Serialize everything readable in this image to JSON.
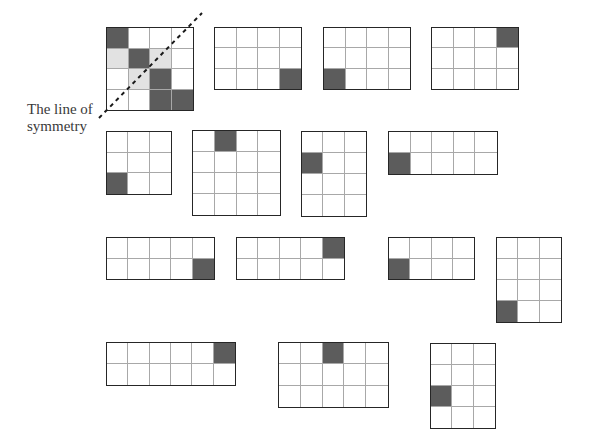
{
  "annotation": {
    "line1": "The line of",
    "line2": "symmetry"
  },
  "colors": {
    "shaded": "#5c5c5c",
    "reflected": "#e2e2e2",
    "empty": "#ffffff",
    "border": "#262626",
    "gridline": "#a8a8a8"
  },
  "grids": [
    {
      "name": "example-grid",
      "rows": 4,
      "cols": 4,
      "dark": [
        [
          0,
          0
        ],
        [
          1,
          1
        ],
        [
          2,
          2
        ],
        [
          3,
          2
        ],
        [
          3,
          3
        ]
      ],
      "light": [
        [
          1,
          0
        ],
        [
          1,
          2
        ],
        [
          2,
          1
        ]
      ]
    },
    {
      "name": "grid-2",
      "rows": 3,
      "cols": 4,
      "dark": [
        [
          2,
          3
        ]
      ],
      "light": []
    },
    {
      "name": "grid-3",
      "rows": 3,
      "cols": 4,
      "dark": [
        [
          2,
          0
        ]
      ],
      "light": []
    },
    {
      "name": "grid-4",
      "rows": 3,
      "cols": 4,
      "dark": [
        [
          0,
          3
        ]
      ],
      "light": []
    },
    {
      "name": "grid-5",
      "rows": 3,
      "cols": 3,
      "dark": [
        [
          2,
          0
        ]
      ],
      "light": []
    },
    {
      "name": "grid-6",
      "rows": 4,
      "cols": 4,
      "dark": [
        [
          0,
          1
        ]
      ],
      "light": []
    },
    {
      "name": "grid-7",
      "rows": 4,
      "cols": 3,
      "dark": [
        [
          1,
          0
        ]
      ],
      "light": []
    },
    {
      "name": "grid-8",
      "rows": 2,
      "cols": 5,
      "dark": [
        [
          1,
          0
        ]
      ],
      "light": []
    },
    {
      "name": "grid-9",
      "rows": 2,
      "cols": 5,
      "dark": [
        [
          1,
          4
        ]
      ],
      "light": []
    },
    {
      "name": "grid-10",
      "rows": 2,
      "cols": 5,
      "dark": [
        [
          0,
          4
        ]
      ],
      "light": []
    },
    {
      "name": "grid-11",
      "rows": 2,
      "cols": 4,
      "dark": [
        [
          1,
          0
        ]
      ],
      "light": []
    },
    {
      "name": "grid-12",
      "rows": 4,
      "cols": 3,
      "dark": [
        [
          3,
          0
        ]
      ],
      "light": []
    },
    {
      "name": "grid-13",
      "rows": 2,
      "cols": 6,
      "dark": [
        [
          0,
          5
        ]
      ],
      "light": []
    },
    {
      "name": "grid-14",
      "rows": 3,
      "cols": 5,
      "dark": [
        [
          0,
          2
        ]
      ],
      "light": []
    },
    {
      "name": "grid-15",
      "rows": 4,
      "cols": 3,
      "dark": [
        [
          2,
          0
        ]
      ],
      "light": []
    }
  ]
}
